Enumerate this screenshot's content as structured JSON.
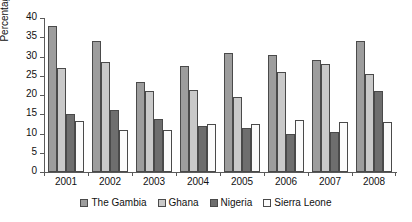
{
  "chart_data": {
    "type": "bar",
    "title": "",
    "xlabel": "",
    "ylabel": "Percentage",
    "ylim": [
      0,
      40
    ],
    "yticks": [
      0,
      5,
      10,
      15,
      20,
      25,
      30,
      35,
      40
    ],
    "ytick_labels": [
      "0",
      "5",
      "10",
      "15",
      "20",
      "25",
      "30",
      "35",
      "40"
    ],
    "grid": false,
    "legend_position": "bottom",
    "categories": [
      "2001",
      "2002",
      "2003",
      "2004",
      "2005",
      "2006",
      "2007",
      "2008"
    ],
    "series": [
      {
        "name": "The Gambia",
        "color": "#9d9d9d",
        "values": [
          38.0,
          34.0,
          23.5,
          27.5,
          31.0,
          30.5,
          29.0,
          34.0
        ]
      },
      {
        "name": "Ghana",
        "color": "#c9c9c9",
        "values": [
          27.0,
          28.7,
          21.0,
          21.3,
          19.5,
          26.0,
          28.0,
          25.5
        ]
      },
      {
        "name": "Nigeria",
        "color": "#6e6e6e",
        "values": [
          15.0,
          16.0,
          13.8,
          12.0,
          11.5,
          10.0,
          10.5,
          21.0
        ]
      },
      {
        "name": "Sierra Leone",
        "color": "#fbfbfb",
        "values": [
          13.3,
          11.0,
          10.8,
          12.5,
          12.5,
          13.5,
          13.0,
          13.0
        ]
      }
    ]
  },
  "axis": {
    "y_title": "Percentage"
  }
}
